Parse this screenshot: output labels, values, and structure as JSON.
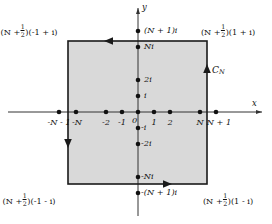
{
  "figure": {
    "background": "#ffffff",
    "region_fill": "#d9d9d9",
    "line_color": "#1a1a1a",
    "axis_color": "#333333",
    "width": 272,
    "height": 224
  },
  "axes": {
    "x_label": "x",
    "y_label": "y",
    "origin_label": "0",
    "x_axis_y": 112,
    "y_axis_x": 138,
    "unit_px": 16
  },
  "contour": {
    "name": "C_N",
    "name_base": "C",
    "name_sub": "N",
    "orientation": "counterclockwise",
    "left": 68,
    "right": 207,
    "top": 41,
    "bottom": 184,
    "arrows": [
      {
        "edge": "top",
        "direction": "left"
      },
      {
        "edge": "left",
        "direction": "down"
      },
      {
        "edge": "bottom",
        "direction": "right"
      },
      {
        "edge": "right",
        "direction": "up"
      }
    ]
  },
  "corner_labels": [
    {
      "id": "top-left",
      "prefix": "(N +",
      "frac_num": "1",
      "frac_den": "2",
      "suffix": ")(-1 + i)",
      "x": 29,
      "y": 28
    },
    {
      "id": "top-right",
      "prefix": "(N +",
      "frac_num": "1",
      "frac_den": "2",
      "suffix": ")(1 + i)",
      "x": 200,
      "y": 28
    },
    {
      "id": "bottom-left",
      "prefix": "(N +",
      "frac_num": "1",
      "frac_den": "2",
      "suffix": ")(-1 - i)",
      "x": 29,
      "y": 195
    },
    {
      "id": "bottom-right",
      "prefix": "(N +",
      "frac_num": "1",
      "frac_den": "2",
      "suffix": ")(1 - i)",
      "x": 200,
      "y": 195
    }
  ],
  "x_points": [
    {
      "label": "-N - 1",
      "value": -5,
      "x": 59,
      "label_x": 59,
      "label_y": 120
    },
    {
      "label": "-N",
      "value": -4,
      "x": 76,
      "label_x": 76,
      "label_y": 120
    },
    {
      "label": "-2",
      "value": -2,
      "x": 106,
      "label_x": 106,
      "label_y": 120
    },
    {
      "label": "-1",
      "value": -1,
      "x": 122,
      "label_x": 122,
      "label_y": 120
    },
    {
      "label": "1",
      "value": 1,
      "x": 154,
      "label_x": 154,
      "label_y": 120
    },
    {
      "label": "2",
      "value": 2,
      "x": 170,
      "label_x": 170,
      "label_y": 120
    },
    {
      "label": "N",
      "value": 4,
      "x": 200,
      "label_x": 200,
      "label_y": 120
    },
    {
      "label": "N + 1",
      "value": 5,
      "x": 216,
      "label_x": 218,
      "label_y": 120
    }
  ],
  "origin_point": {
    "label": "0",
    "x": 138,
    "label_x": 134,
    "label_y": 120
  },
  "y_points": [
    {
      "label": "(N + 1)i",
      "value": 5,
      "y": 31,
      "label_x": 144,
      "label_y": 31
    },
    {
      "label": "Ni",
      "value": 4,
      "y": 47,
      "label_x": 144,
      "label_y": 47
    },
    {
      "label": "2i",
      "value": 2,
      "y": 80,
      "label_x": 144,
      "label_y": 80
    },
    {
      "label": "i",
      "value": 1,
      "y": 96,
      "label_x": 144,
      "label_y": 96
    },
    {
      "label": "-i",
      "value": -1,
      "y": 128,
      "label_x": 141,
      "label_y": 128
    },
    {
      "label": "-2i",
      "value": -2,
      "y": 144,
      "label_x": 141,
      "label_y": 144
    },
    {
      "label": "-Ni",
      "value": -4,
      "y": 177,
      "label_x": 141,
      "label_y": 177
    },
    {
      "label": "-(N + 1)i",
      "value": -5,
      "y": 193,
      "label_x": 141,
      "label_y": 193
    }
  ],
  "contour_label": {
    "text": "C_N",
    "x": 212,
    "y": 71
  }
}
